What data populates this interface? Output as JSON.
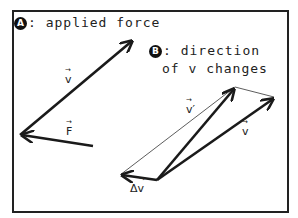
{
  "panel_a": {
    "badge": "A",
    "title": ":  applied force",
    "vector_v_label": "v",
    "vector_f_label": "F"
  },
  "panel_b": {
    "badge": "B",
    "title_line1": ":  direction",
    "title_line2": "of v changes",
    "vector_v_prime_label": "v′",
    "vector_v_label": "v",
    "delta_v_label": "Δv"
  },
  "vector_arrow_glyph": "⃗",
  "colors": {
    "stroke": "#1a1a1a",
    "frame": "#222222",
    "background": "#ffffff"
  }
}
